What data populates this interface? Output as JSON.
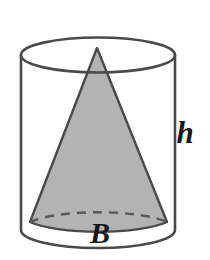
{
  "figure": {
    "kind": "geometry-diagram",
    "background_color": "#ffffff",
    "outline_color": "#4a4a4a",
    "cone_fill_color": "#b3b3b3",
    "label_color": "#171717",
    "labels": {
      "height": "h",
      "base": "B"
    },
    "solids": {
      "cylinder": {
        "name": "cylinder",
        "center_x": 98,
        "radius_x": 77,
        "radius_y": 17.5,
        "top_center_y": 55,
        "bottom_center_y": 230,
        "hidden_back_arc": false
      },
      "cone": {
        "name": "cone",
        "apex_x": 97,
        "apex_y": 48,
        "base_left_x": 30,
        "base_right_x": 167,
        "base_y": 222,
        "base_center_x": 98,
        "base_center_y": 230,
        "base_radius_x": 77,
        "base_radius_y": 18,
        "hidden_back_arc": true
      }
    },
    "label_positions": {
      "height": {
        "x": 185,
        "y": 143
      },
      "base": {
        "x": 100,
        "y": 243
      }
    }
  }
}
